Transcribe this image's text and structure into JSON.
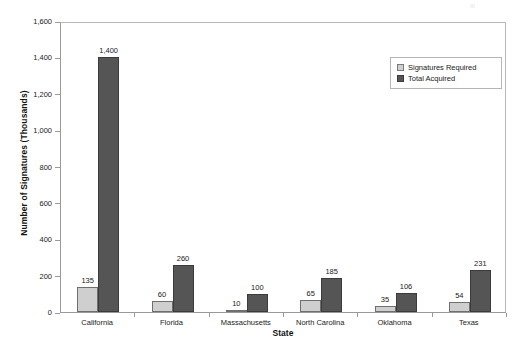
{
  "chart_data": {
    "type": "bar",
    "title": "",
    "xlabel": "State",
    "ylabel": "Number of Signatures (Thousands)",
    "categories": [
      "California",
      "Florida",
      "Massachusetts",
      "North Carolina",
      "Oklahoma",
      "Texas"
    ],
    "series": [
      {
        "name": "Signatures Required",
        "color": "#cfcfcf",
        "values": [
          135,
          60,
          10,
          65,
          35,
          54
        ],
        "labels": [
          "135",
          "60",
          "10",
          "65",
          "35",
          "54"
        ]
      },
      {
        "name": "Total Acquired",
        "color": "#555555",
        "values": [
          1400,
          260,
          100,
          185,
          106,
          231
        ],
        "labels": [
          "1,400",
          "260",
          "100",
          "185",
          "106",
          "231"
        ]
      }
    ],
    "ylim": [
      0,
      1600
    ],
    "ytick_values": [
      0,
      200,
      400,
      600,
      800,
      1000,
      1200,
      1400,
      1600
    ],
    "ytick_labels": [
      "0",
      "200",
      "400",
      "600",
      "800",
      "1,000",
      "1,200",
      "1,400",
      "1,600"
    ],
    "grid": false,
    "legend_position": "upper-right",
    "legend_entries": [
      "Signatures Required",
      "Total Acquired"
    ]
  }
}
